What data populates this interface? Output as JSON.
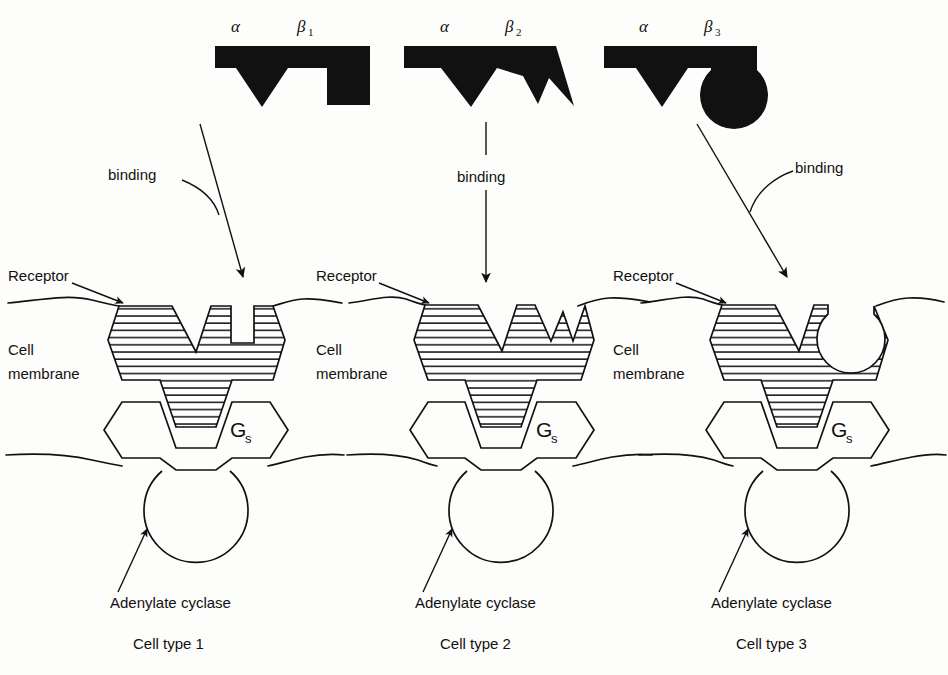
{
  "figure": {
    "background_color": "#fdfdfb",
    "ink_color": "#111111"
  },
  "labels": {
    "receptor": "Receptor",
    "cell_membrane_line1": "Cell",
    "cell_membrane_line2": "membrane",
    "adenylate_cyclase": "Adenylate cyclase",
    "binding": "binding",
    "g_protein": "G",
    "g_protein_subscript": "s",
    "alpha": "α",
    "beta": "β"
  },
  "panels": [
    {
      "id": "panel-1",
      "caption": "Cell type 1",
      "ligand": {
        "alpha_label": "α",
        "beta_label": "β",
        "beta_subscript": "1",
        "alpha_shape": "v-wedge",
        "beta_shape": "rectangular-peg"
      },
      "receptor": {
        "alpha_site": "v-notch",
        "beta_site": "rectangular-slot"
      },
      "binding_arrow": "diagonal-down-right",
      "binding_label": "binding"
    },
    {
      "id": "panel-2",
      "caption": "Cell type 2",
      "ligand": {
        "alpha_label": "α",
        "beta_label": "β",
        "beta_subscript": "2",
        "alpha_shape": "v-wedge",
        "beta_shape": "sawtooth-spikes"
      },
      "receptor": {
        "alpha_site": "v-notch",
        "beta_site": "sawtooth-slot"
      },
      "binding_arrow": "vertical-down",
      "binding_label": "binding"
    },
    {
      "id": "panel-3",
      "caption": "Cell type 3",
      "ligand": {
        "alpha_label": "α",
        "beta_label": "β",
        "beta_subscript": "3",
        "alpha_shape": "v-wedge",
        "beta_shape": "circular-knob"
      },
      "receptor": {
        "alpha_site": "v-notch",
        "beta_site": "circular-socket"
      },
      "binding_arrow": "diagonal-down-left",
      "binding_label": "binding"
    }
  ]
}
